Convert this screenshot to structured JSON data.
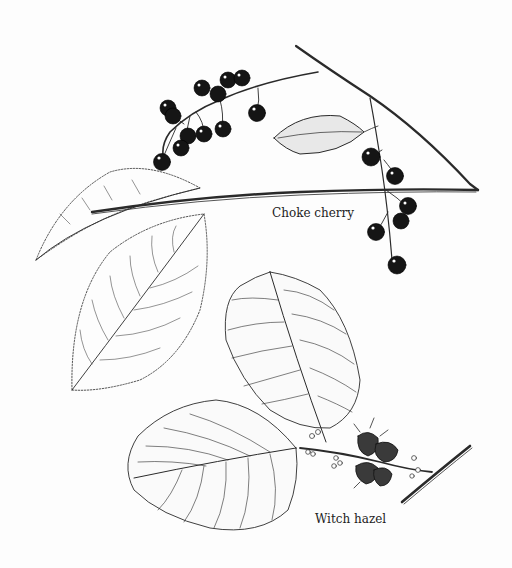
{
  "illustration": {
    "type": "botanical line drawing",
    "background": "#fdfdfd",
    "ink_color": "#1a1a1a",
    "specimens": [
      {
        "id": "choke-cherry",
        "label": "Choke cherry",
        "parts": [
          "twig",
          "fruit clusters (dark cherries)",
          "leaves (finely serrated, dotted margin)",
          "small shaded leaf"
        ]
      },
      {
        "id": "witch-hazel",
        "label": "Witch hazel",
        "parts": [
          "twig",
          "two wavy-margined leaves with parallel veins",
          "seed capsules",
          "flower buds"
        ]
      }
    ]
  }
}
